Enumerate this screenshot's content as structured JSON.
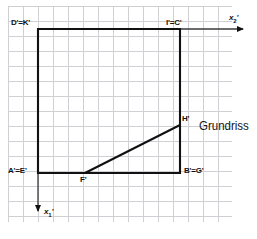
{
  "figure": {
    "view_name": "Grundriss",
    "background_color": "#ffffff",
    "grid_color": "#cfcfd4",
    "ink_color": "#111111",
    "grid_spacing_px": 15
  },
  "axes": {
    "horizontal": {
      "label": "x",
      "subscript": "2",
      "prime": "'",
      "direction": "right",
      "arrow": "arrow-right"
    },
    "vertical": {
      "label": "x",
      "subscript": "1",
      "prime": "'",
      "direction": "down",
      "arrow": "arrow-down"
    }
  },
  "point_labels": [
    {
      "id": "d-k",
      "text": "D'=K'",
      "x": 11,
      "y": 19
    },
    {
      "id": "i-c",
      "text": "I'=C'",
      "x": 166,
      "y": 19
    },
    {
      "id": "a-e",
      "text": "A'=E'",
      "x": 8,
      "y": 167
    },
    {
      "id": "b-g",
      "text": "B'=G'",
      "x": 184,
      "y": 167
    },
    {
      "id": "h",
      "text": "H'",
      "x": 182,
      "y": 115
    },
    {
      "id": "f",
      "text": "F'",
      "x": 80,
      "y": 176
    }
  ],
  "geometry": {
    "square": {
      "top_left": [
        38,
        29
      ],
      "top_right": [
        180,
        29
      ],
      "bottom_right": [
        180,
        173
      ],
      "bottom_left": [
        38,
        173
      ]
    },
    "diagonal_edge": {
      "from": [
        85,
        173
      ],
      "to": [
        180,
        125
      ]
    },
    "axis_horizontal": {
      "from": [
        38,
        29
      ],
      "to": [
        247,
        29
      ]
    },
    "axis_vertical": {
      "from": [
        38,
        29
      ],
      "to": [
        38,
        217
      ]
    }
  }
}
